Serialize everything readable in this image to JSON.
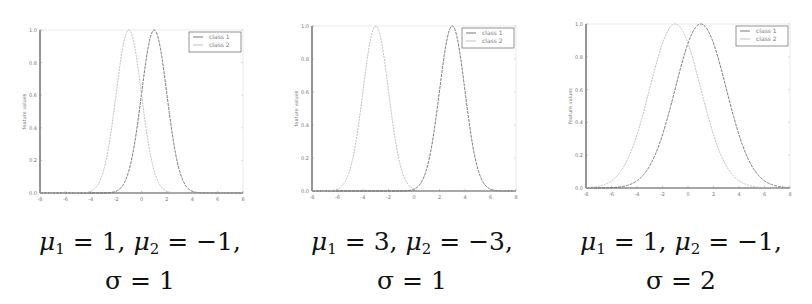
{
  "chart_data": [
    {
      "type": "line",
      "title": "",
      "caption": {
        "mu1": "1",
        "mu2": "−1",
        "sigma": "1"
      },
      "xlabel": "",
      "ylabel": "feature values",
      "xlim": [
        -8,
        8
      ],
      "ylim": [
        0.0,
        1.0
      ],
      "xticks": [
        "-8",
        "-6",
        "-4",
        "-2",
        "0",
        "2",
        "4",
        "6",
        "8"
      ],
      "yticks": [
        "0.0",
        "0.2",
        "0.4",
        "0.6",
        "0.8",
        "1.0"
      ],
      "grid": false,
      "legend_position": "upper right",
      "series": [
        {
          "name": "class 1",
          "mean": 1,
          "sigma": 1,
          "peak": 1.0,
          "color": "#6a6a6a"
        },
        {
          "name": "class 2",
          "mean": -1,
          "sigma": 1,
          "peak": 1.0,
          "color": "#b8b8b8"
        }
      ]
    },
    {
      "type": "line",
      "title": "",
      "caption": {
        "mu1": "3",
        "mu2": "−3",
        "sigma": "1"
      },
      "xlabel": "",
      "ylabel": "feature values",
      "xlim": [
        -8,
        8
      ],
      "ylim": [
        0.0,
        1.0
      ],
      "xticks": [
        "-8",
        "-6",
        "-4",
        "-2",
        "0",
        "2",
        "4",
        "6",
        "8"
      ],
      "yticks": [
        "0.0",
        "0.2",
        "0.4",
        "0.6",
        "0.8",
        "1.0"
      ],
      "grid": false,
      "legend_position": "upper right",
      "series": [
        {
          "name": "class 1",
          "mean": 3,
          "sigma": 1,
          "peak": 1.0,
          "color": "#6a6a6a"
        },
        {
          "name": "class 2",
          "mean": -3,
          "sigma": 1,
          "peak": 1.0,
          "color": "#b8b8b8"
        }
      ]
    },
    {
      "type": "line",
      "title": "",
      "caption": {
        "mu1": "1",
        "mu2": "−1",
        "sigma": "2"
      },
      "xlabel": "",
      "ylabel": "feature values",
      "xlim": [
        -8,
        8
      ],
      "ylim": [
        0.0,
        1.0
      ],
      "xticks": [
        "-8",
        "-6",
        "-4",
        "-2",
        "0",
        "2",
        "4",
        "6",
        "8"
      ],
      "yticks": [
        "0.0",
        "0.2",
        "0.4",
        "0.6",
        "0.8",
        "1.0"
      ],
      "grid": false,
      "legend_position": "upper right",
      "series": [
        {
          "name": "class 1",
          "mean": 1,
          "sigma": 2,
          "peak": 1.0,
          "color": "#6a6a6a"
        },
        {
          "name": "class 2",
          "mean": -1,
          "sigma": 2,
          "peak": 1.0,
          "color": "#b8b8b8"
        }
      ]
    }
  ],
  "captions": [
    {
      "mu1_label": "μ",
      "mu1_sub": "1",
      "eq1": " = 1, ",
      "mu2_label": "μ",
      "mu2_sub": "2",
      "eq2": " = −1,",
      "sigma_line": "σ = 1"
    },
    {
      "mu1_label": "μ",
      "mu1_sub": "1",
      "eq1": " = 3, ",
      "mu2_label": "μ",
      "mu2_sub": "2",
      "eq2": " = −3,",
      "sigma_line": "σ = 1"
    },
    {
      "mu1_label": "μ",
      "mu1_sub": "1",
      "eq1": " = 1, ",
      "mu2_label": "μ",
      "mu2_sub": "2",
      "eq2": " = −1,",
      "sigma_line": "σ = 2"
    }
  ]
}
